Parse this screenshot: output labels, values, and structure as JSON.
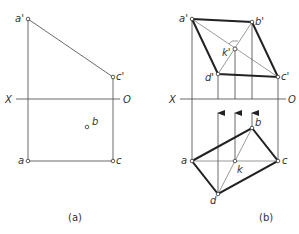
{
  "figure": {
    "panel_a": {
      "caption": "(a)",
      "axis": {
        "left_label": "X",
        "right_label": "O"
      },
      "points": {
        "a_prime": {
          "label": "a'"
        },
        "c_prime": {
          "label": "c'"
        },
        "a": {
          "label": "a"
        },
        "b": {
          "label": "b"
        },
        "c": {
          "label": "c"
        }
      }
    },
    "panel_b": {
      "caption": "(b)",
      "axis": {
        "left_label": "X",
        "right_label": "O"
      },
      "points": {
        "a_prime": {
          "label": "a'"
        },
        "b_prime": {
          "label": "b'"
        },
        "c_prime": {
          "label": "c'"
        },
        "d_prime": {
          "label": "d'"
        },
        "k_prime": {
          "label": "k'"
        },
        "a": {
          "label": "a"
        },
        "b": {
          "label": "b"
        },
        "c": {
          "label": "c"
        },
        "d": {
          "label": "d"
        },
        "k": {
          "label": "k"
        }
      }
    }
  }
}
